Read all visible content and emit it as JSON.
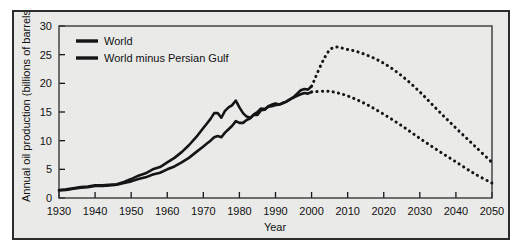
{
  "figure": {
    "background_color": "#ececeb",
    "border_color": "#2c2c2c",
    "line_color": "#151515"
  },
  "chart_data": {
    "type": "line",
    "title": "",
    "xlabel": "Year",
    "ylabel": "Annual oil production (billions of barrels)",
    "xlim": [
      1930,
      2050
    ],
    "ylim": [
      0,
      30
    ],
    "xticks": [
      1930,
      1940,
      1950,
      1960,
      1970,
      1980,
      1990,
      2000,
      2010,
      2020,
      2030,
      2040,
      2050
    ],
    "yticks": [
      0,
      5,
      10,
      15,
      20,
      25,
      30
    ],
    "grid": false,
    "legend_position": "top-left",
    "series": [
      {
        "name": "World",
        "style": "solid-then-dotted",
        "historical_end_year": 2000,
        "x": [
          1930,
          1932,
          1934,
          1936,
          1938,
          1940,
          1942,
          1944,
          1946,
          1948,
          1950,
          1952,
          1954,
          1956,
          1958,
          1960,
          1962,
          1964,
          1966,
          1968,
          1970,
          1971,
          1972,
          1973,
          1974,
          1975,
          1976,
          1977,
          1978,
          1979,
          1980,
          1981,
          1982,
          1983,
          1984,
          1985,
          1986,
          1987,
          1988,
          1989,
          1990,
          1991,
          1992,
          1993,
          1994,
          1995,
          1996,
          1997,
          1998,
          1999,
          2000
        ],
        "values": [
          1.4,
          1.5,
          1.7,
          1.9,
          2.0,
          2.2,
          2.2,
          2.3,
          2.4,
          2.8,
          3.3,
          3.9,
          4.3,
          5.0,
          5.4,
          6.2,
          7.0,
          8.0,
          9.2,
          10.6,
          12.2,
          13.0,
          13.8,
          14.8,
          14.8,
          14.0,
          15.2,
          15.8,
          16.2,
          17.0,
          15.8,
          14.8,
          14.2,
          14.0,
          14.5,
          14.5,
          15.3,
          15.4,
          16.0,
          16.3,
          16.5,
          16.3,
          16.5,
          16.8,
          17.2,
          17.6,
          18.2,
          18.8,
          19.0,
          18.9,
          19.5
        ],
        "projection_x": [
          2000,
          2005,
          2010,
          2015,
          2020,
          2025,
          2030,
          2035,
          2040,
          2045,
          2050
        ],
        "projection_values": [
          19.5,
          25.8,
          25.9,
          25.0,
          23.5,
          21.3,
          18.5,
          15.3,
          12.2,
          9.2,
          6.2
        ]
      },
      {
        "name": "World minus Persian Gulf",
        "style": "solid-then-dotted",
        "historical_end_year": 2000,
        "x": [
          1930,
          1932,
          1934,
          1936,
          1938,
          1940,
          1942,
          1944,
          1946,
          1948,
          1950,
          1952,
          1954,
          1956,
          1958,
          1960,
          1962,
          1964,
          1966,
          1968,
          1970,
          1971,
          1972,
          1973,
          1974,
          1975,
          1976,
          1977,
          1978,
          1979,
          1980,
          1981,
          1982,
          1983,
          1984,
          1985,
          1986,
          1987,
          1988,
          1989,
          1990,
          1991,
          1992,
          1993,
          1994,
          1995,
          1996,
          1997,
          1998,
          1999,
          2000
        ],
        "values": [
          1.3,
          1.4,
          1.6,
          1.8,
          1.9,
          2.1,
          2.1,
          2.2,
          2.3,
          2.6,
          2.9,
          3.3,
          3.6,
          4.1,
          4.4,
          5.0,
          5.5,
          6.2,
          7.0,
          8.0,
          9.0,
          9.5,
          10.0,
          10.6,
          10.8,
          10.6,
          11.4,
          12.0,
          12.6,
          13.4,
          13.1,
          13.1,
          13.6,
          13.9,
          14.6,
          15.0,
          15.6,
          15.5,
          15.9,
          16.0,
          16.2,
          16.3,
          16.6,
          16.8,
          17.2,
          17.5,
          17.8,
          18.1,
          18.3,
          18.2,
          18.5
        ],
        "projection_x": [
          2000,
          2005,
          2010,
          2015,
          2020,
          2025,
          2030,
          2035,
          2040,
          2045,
          2050
        ],
        "projection_values": [
          18.5,
          18.6,
          17.8,
          16.4,
          14.6,
          12.6,
          10.4,
          8.3,
          6.3,
          4.3,
          2.6
        ]
      }
    ]
  },
  "legend": {
    "items": [
      {
        "label": "World"
      },
      {
        "label": "World minus Persian Gulf"
      }
    ]
  }
}
